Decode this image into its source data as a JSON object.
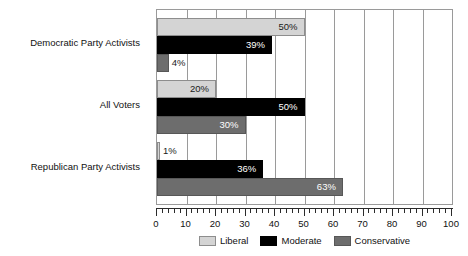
{
  "chart_data": {
    "type": "bar",
    "orientation": "horizontal",
    "title": "",
    "subtitle": "",
    "xlabel": "",
    "ylabel": "",
    "xlim": [
      0,
      100
    ],
    "grid": true,
    "grid_axis": "x",
    "legend_position": "bottom",
    "categories": [
      "Democratic Party Activists",
      "All Voters",
      "Republican Party Activists"
    ],
    "xticks": [
      0,
      10,
      20,
      30,
      40,
      50,
      60,
      70,
      80,
      90,
      100
    ],
    "xtick_labels": [
      "0",
      "10",
      "20",
      "30",
      "40",
      "50",
      "60",
      "70",
      "80",
      "90",
      "100"
    ],
    "minor_tick_step": 2,
    "series": [
      {
        "name": "Liberal",
        "color": "#d4d4d4",
        "values": [
          50,
          20,
          1
        ],
        "data_labels": [
          "50%",
          "20%",
          "1%"
        ]
      },
      {
        "name": "Moderate",
        "color": "#000000",
        "values": [
          39,
          50,
          36
        ],
        "data_labels": [
          "39%",
          "50%",
          "36%"
        ]
      },
      {
        "name": "Conservative",
        "color": "#6d6d6d",
        "values": [
          4,
          30,
          63
        ],
        "data_labels": [
          "4%",
          "30%",
          "63%"
        ]
      }
    ]
  },
  "legend": {
    "items": [
      {
        "label": "Liberal",
        "swatch": "liberal"
      },
      {
        "label": "Moderate",
        "swatch": "moderate"
      },
      {
        "label": "Conservative",
        "swatch": "conservative"
      }
    ]
  }
}
